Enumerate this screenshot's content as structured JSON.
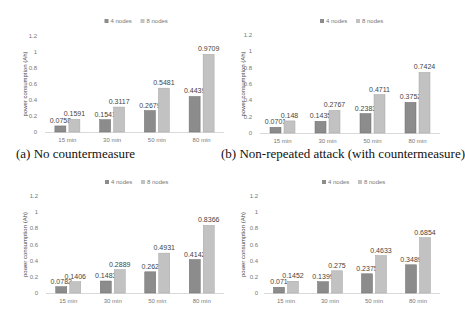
{
  "chart_data": [
    {
      "type": "bar",
      "panel": "a",
      "caption": "(a) No countermeasure",
      "categories": [
        "15 min",
        "30 min",
        "50 min",
        "80 min"
      ],
      "series": [
        {
          "name": "4 nodes",
          "values": [
            0.0758,
            0.1541,
            0.2679,
            0.4439
          ],
          "labels": [
            "0.0758",
            "0.1541",
            "0.2679",
            "0.4439"
          ]
        },
        {
          "name": "8 nodes",
          "values": [
            0.1591,
            0.3117,
            0.5481,
            0.9709
          ],
          "labels": [
            "0.1591",
            "0.3117",
            "0.5481",
            "0.9709"
          ]
        }
      ],
      "xlabel": "",
      "ylabel": "power consumption (Ah)",
      "ylim": [
        0,
        1.2
      ],
      "yticks": [
        "0",
        "0.2",
        "0.4",
        "0.6",
        "0.8",
        "1",
        "1.2"
      ],
      "grid": false,
      "legend_position": "top"
    },
    {
      "type": "bar",
      "panel": "b",
      "caption": "(b) Non-repeated attack (with countermeasure)",
      "categories": [
        "15 min",
        "30 min",
        "50 min",
        "80 min"
      ],
      "series": [
        {
          "name": "4 nodes",
          "values": [
            0.0701,
            0.1435,
            0.2383,
            0.3752
          ],
          "labels": [
            "0.0701",
            "0.1435",
            "0.2383",
            "0.3752"
          ]
        },
        {
          "name": "8 nodes",
          "values": [
            0.148,
            0.2767,
            0.4711,
            0.7424
          ],
          "labels": [
            "0.148",
            "0.2767",
            "0.4711",
            "0.7424"
          ]
        }
      ],
      "xlabel": "",
      "ylabel": "power consumption (Ah)",
      "ylim": [
        0,
        1.2
      ],
      "yticks": [
        "0",
        "0.2",
        "0.4",
        "0.6",
        "0.8",
        "1",
        "1.2"
      ],
      "grid": false,
      "legend_position": "top"
    },
    {
      "type": "bar",
      "panel": "c",
      "caption": "",
      "categories": [
        "15 min",
        "30 min",
        "50 min",
        "80 min"
      ],
      "series": [
        {
          "name": "4 nodes",
          "values": [
            0.0782,
            0.1483,
            0.262,
            0.4142
          ],
          "labels": [
            "0.0782",
            "0.1483",
            "0.262",
            "0.4142"
          ]
        },
        {
          "name": "8 nodes",
          "values": [
            0.1406,
            0.2889,
            0.4931,
            0.8366
          ],
          "labels": [
            "0.1406",
            "0.2889",
            "0.4931",
            "0.8366"
          ]
        }
      ],
      "xlabel": "",
      "ylabel": "power consumption (Ah)",
      "ylim": [
        0,
        1.2
      ],
      "yticks": [
        "0",
        "0.2",
        "0.4",
        "0.6",
        "0.8",
        "1",
        "1.2"
      ],
      "grid": false,
      "legend_position": "top"
    },
    {
      "type": "bar",
      "panel": "d",
      "caption": "",
      "categories": [
        "15 min",
        "30 min",
        "50 min",
        "80 min"
      ],
      "series": [
        {
          "name": "4 nodes",
          "values": [
            0.071,
            0.1399,
            0.2375,
            0.3489
          ],
          "labels": [
            "0.071",
            "0.1399",
            "0.2375",
            "0.3489"
          ]
        },
        {
          "name": "8 nodes",
          "values": [
            0.1452,
            0.275,
            0.4633,
            0.6854
          ],
          "labels": [
            "0.1452",
            "0.275",
            "0.4633",
            "0.6854"
          ]
        }
      ],
      "xlabel": "",
      "ylabel": "power consumption (Ah)",
      "ylim": [
        0,
        1.2
      ],
      "yticks": [
        "0",
        "0.2",
        "0.4",
        "0.6",
        "0.8",
        "1",
        "1.2"
      ],
      "grid": false,
      "legend_position": "top"
    }
  ],
  "colors": {
    "series_4_nodes": "#8c8c8c",
    "series_4_nodes_border": "#6e6e6e",
    "series_8_nodes": "#c2c2c2",
    "series_8_nodes_border": "#a6a6a6",
    "axis": "#d9d9d9",
    "tick_text": "#777777",
    "label_text": "#444444"
  }
}
